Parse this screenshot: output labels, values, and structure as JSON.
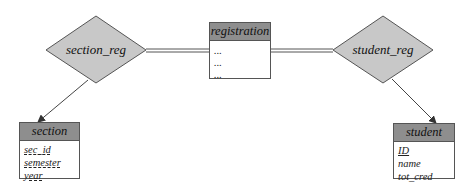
{
  "relationships": [
    {
      "id": "section_reg",
      "label": "section_reg"
    },
    {
      "id": "student_reg",
      "label": "student_reg"
    }
  ],
  "entities": {
    "registration": {
      "title": "registration",
      "attributes": [
        "...",
        "...",
        "..."
      ]
    },
    "section": {
      "title": "section",
      "attributes": [
        "sec_id",
        "semester",
        "year"
      ]
    },
    "student": {
      "title": "student",
      "attributes": [
        "ID",
        "name",
        "tot_cred"
      ]
    }
  },
  "colors": {
    "diamond_fill": "#c8c8c8",
    "header_fill": "#8e8e8e",
    "line": "#444444"
  }
}
